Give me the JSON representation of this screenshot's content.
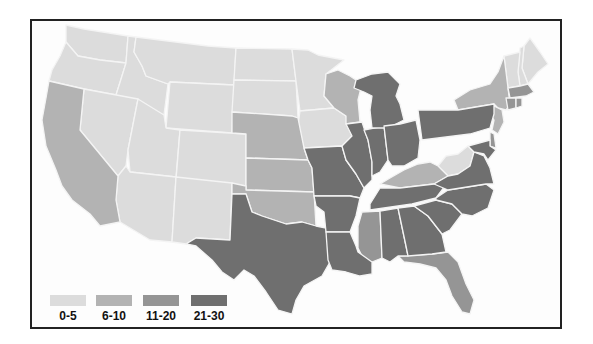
{
  "map": {
    "subject": "United States (contiguous 48 states) choropleth map",
    "colors": {
      "c1": "#dcdcdc",
      "c2": "#b3b3b3",
      "c3": "#959595",
      "c4": "#6f6f6f",
      "border": "#f4f4f4",
      "frame": "#222222"
    }
  },
  "legend": {
    "items": [
      {
        "label": "0-5",
        "color": "#dcdcdc"
      },
      {
        "label": "6-10",
        "color": "#b3b3b3"
      },
      {
        "label": "11-20",
        "color": "#959595"
      },
      {
        "label": "21-30",
        "color": "#6f6f6f"
      }
    ]
  },
  "states": {
    "0-5": [
      "WA",
      "OR",
      "ID",
      "MT",
      "WY",
      "NV",
      "UT",
      "CO",
      "AZ",
      "NM",
      "ND",
      "SD",
      "MN",
      "IA",
      "WV",
      "ME",
      "NH",
      "VT"
    ],
    "6-10": [
      "CA",
      "NE",
      "KS",
      "OK",
      "WI",
      "NY",
      "KY",
      "NJ"
    ],
    "11-20": [
      "MS",
      "MA",
      "CT",
      "RI",
      "DE",
      "FL"
    ],
    "21-30": [
      "TX",
      "MO",
      "AR",
      "LA",
      "IL",
      "IN",
      "MI",
      "OH",
      "PA",
      "TN",
      "AL",
      "GA",
      "SC",
      "NC",
      "VA",
      "MD"
    ]
  }
}
